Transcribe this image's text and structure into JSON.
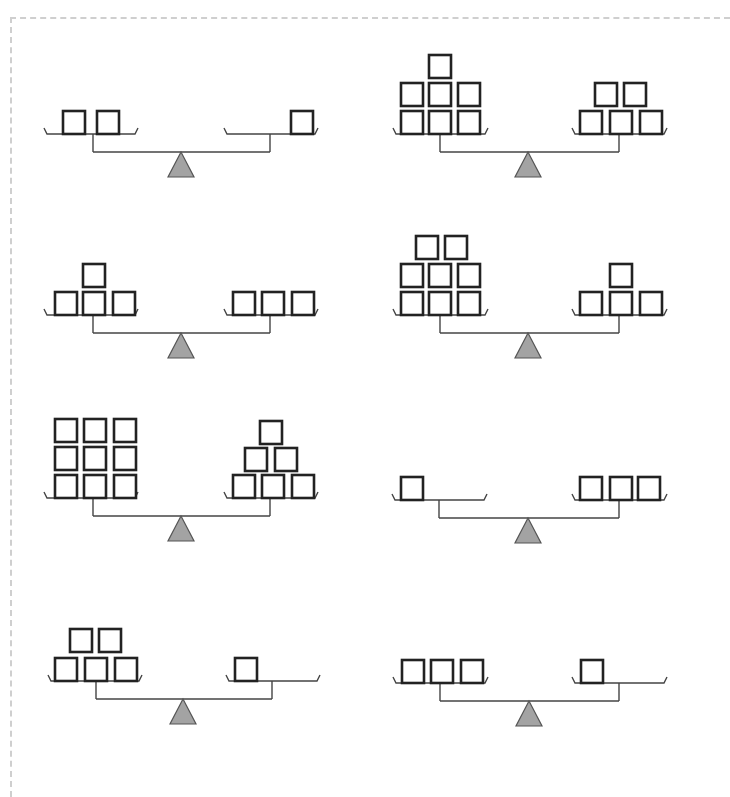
{
  "worksheet": {
    "title": "",
    "frame": {
      "style": "dashed",
      "color": "#cfcfcf"
    },
    "colors": {
      "block_stroke": "#222222",
      "line": "#444444",
      "fulcrum_fill": "#a3a3a3"
    },
    "block_size": 23,
    "block_pitch_x": 29,
    "block_pitch_y": 28,
    "scales": [
      {
        "id": 1,
        "column": "left",
        "pan_y": 134,
        "left_pan": {
          "x1": 44,
          "x2": 138,
          "post_x": 93,
          "count": 2,
          "rows": [
            {
              "y_offset": 0,
              "xs": [
                62,
                96
              ]
            }
          ]
        },
        "right_pan": {
          "x1": 224,
          "x2": 318,
          "post_x": 270,
          "count": 1,
          "rows": [
            {
              "y_offset": 0,
              "xs": [
                290
              ]
            }
          ]
        },
        "fulcrum_x": 181
      },
      {
        "id": 2,
        "column": "right",
        "pan_y": 134,
        "left_pan": {
          "x1": 393,
          "x2": 488,
          "post_x": 440,
          "count": 7,
          "rows": [
            {
              "y_offset": 0,
              "xs": [
                400,
                428,
                457
              ]
            },
            {
              "y_offset": 28,
              "xs": [
                400,
                428,
                457
              ]
            },
            {
              "y_offset": 56,
              "xs": [
                428
              ]
            }
          ]
        },
        "right_pan": {
          "x1": 572,
          "x2": 667,
          "post_x": 619,
          "count": 5,
          "rows": [
            {
              "y_offset": 0,
              "xs": [
                579,
                609,
                639
              ]
            },
            {
              "y_offset": 28,
              "xs": [
                594,
                623
              ]
            }
          ]
        },
        "fulcrum_x": 528
      },
      {
        "id": 3,
        "column": "left",
        "pan_y": 315,
        "left_pan": {
          "x1": 44,
          "x2": 138,
          "post_x": 93,
          "count": 4,
          "rows": [
            {
              "y_offset": 0,
              "xs": [
                54,
                82,
                112
              ]
            },
            {
              "y_offset": 28,
              "xs": [
                82
              ]
            }
          ]
        },
        "right_pan": {
          "x1": 224,
          "x2": 318,
          "post_x": 270,
          "count": 3,
          "rows": [
            {
              "y_offset": 0,
              "xs": [
                232,
                261,
                291
              ]
            }
          ]
        },
        "fulcrum_x": 181
      },
      {
        "id": 4,
        "column": "right",
        "pan_y": 315,
        "left_pan": {
          "x1": 393,
          "x2": 488,
          "post_x": 440,
          "count": 8,
          "rows": [
            {
              "y_offset": 0,
              "xs": [
                400,
                428,
                457
              ]
            },
            {
              "y_offset": 28,
              "xs": [
                400,
                428,
                457
              ]
            },
            {
              "y_offset": 56,
              "xs": [
                415,
                444
              ]
            }
          ]
        },
        "right_pan": {
          "x1": 572,
          "x2": 667,
          "post_x": 619,
          "count": 4,
          "rows": [
            {
              "y_offset": 0,
              "xs": [
                579,
                609,
                639
              ]
            },
            {
              "y_offset": 28,
              "xs": [
                609
              ]
            }
          ]
        },
        "fulcrum_x": 528
      },
      {
        "id": 5,
        "column": "left",
        "pan_y": 498,
        "left_pan": {
          "x1": 44,
          "x2": 138,
          "post_x": 93,
          "count": 9,
          "rows": [
            {
              "y_offset": 0,
              "xs": [
                54,
                83,
                113
              ]
            },
            {
              "y_offset": 28,
              "xs": [
                54,
                83,
                113
              ]
            },
            {
              "y_offset": 56,
              "xs": [
                54,
                83,
                113
              ]
            }
          ]
        },
        "right_pan": {
          "x1": 224,
          "x2": 318,
          "post_x": 270,
          "count": 6,
          "rows": [
            {
              "y_offset": 0,
              "xs": [
                232,
                261,
                291
              ]
            },
            {
              "y_offset": 27,
              "xs": [
                244,
                274
              ]
            },
            {
              "y_offset": 54,
              "xs": [
                259
              ]
            }
          ]
        },
        "fulcrum_x": 181
      },
      {
        "id": 6,
        "column": "right",
        "pan_y": 500,
        "left_pan": {
          "x1": 392,
          "x2": 487,
          "post_x": 439,
          "count": 1,
          "rows": [
            {
              "y_offset": 0,
              "xs": [
                400
              ]
            }
          ]
        },
        "right_pan": {
          "x1": 572,
          "x2": 667,
          "post_x": 619,
          "count": 3,
          "rows": [
            {
              "y_offset": 0,
              "xs": [
                579,
                609,
                637
              ]
            }
          ]
        },
        "fulcrum_x": 528
      },
      {
        "id": 7,
        "column": "left",
        "pan_y": 681,
        "left_pan": {
          "x1": 48,
          "x2": 142,
          "post_x": 96,
          "count": 5,
          "rows": [
            {
              "y_offset": 0,
              "xs": [
                54,
                84,
                114
              ]
            },
            {
              "y_offset": 29,
              "xs": [
                69,
                98
              ]
            }
          ]
        },
        "right_pan": {
          "x1": 226,
          "x2": 320,
          "post_x": 272,
          "count": 1,
          "rows": [
            {
              "y_offset": 0,
              "xs": [
                234
              ]
            }
          ]
        },
        "fulcrum_x": 183
      },
      {
        "id": 8,
        "column": "right",
        "pan_y": 683,
        "left_pan": {
          "x1": 393,
          "x2": 488,
          "post_x": 440,
          "count": 3,
          "rows": [
            {
              "y_offset": 0,
              "xs": [
                401,
                430,
                460
              ]
            }
          ]
        },
        "right_pan": {
          "x1": 572,
          "x2": 667,
          "post_x": 619,
          "count": 1,
          "rows": [
            {
              "y_offset": 0,
              "xs": [
                580
              ]
            }
          ]
        },
        "fulcrum_x": 529
      }
    ]
  }
}
